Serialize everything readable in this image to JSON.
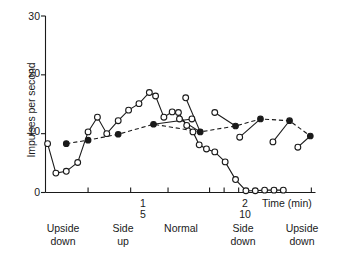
{
  "chart_data": {
    "type": "line",
    "title": "",
    "xlabel": "Time (min)",
    "ylabel": "Impulses per second",
    "ylim": [
      0,
      30
    ],
    "yticks": [
      0,
      10,
      20,
      30
    ],
    "ytick_labels": [
      "0",
      "10",
      "20",
      "30"
    ],
    "xlim": [
      0,
      2.6
    ],
    "xtick_labels_upper": [
      "1",
      "2"
    ],
    "xtick_labels_lower": [
      "5",
      "10"
    ],
    "xtick_label_positions": [
      1.0,
      2.0
    ],
    "grid": false,
    "legend_position": "none",
    "orientation_bands": [
      {
        "line1": "Upside",
        "line2": "down",
        "center_x": 0.13
      },
      {
        "line1": "Side",
        "line2": "up",
        "center_x": 0.72
      },
      {
        "line1": "Normal",
        "line2": "",
        "center_x": 1.28
      },
      {
        "line1": "Side",
        "line2": "down",
        "center_x": 1.94
      },
      {
        "line1": "Upside",
        "line2": "down",
        "center_x": 2.44
      }
    ],
    "series": [
      {
        "name": "open-circle-series",
        "marker": "open circle",
        "linestyle": "solid",
        "x": [
          0.02,
          0.1,
          0.2,
          0.31,
          0.41,
          0.5,
          0.59,
          0.7,
          0.8,
          0.9,
          1.0,
          1.06,
          1.14,
          1.22,
          1.28,
          1.36,
          1.42,
          1.48,
          1.55,
          1.63,
          1.73,
          1.83,
          1.93,
          2.02,
          2.11,
          2.2,
          2.29
        ],
        "y": [
          8.3,
          3.3,
          3.6,
          5.1,
          10.3,
          12.8,
          10.0,
          12.2,
          14.0,
          15.1,
          17.0,
          16.4,
          12.8,
          13.7,
          13.6,
          11.4,
          10.3,
          8.1,
          7.4,
          6.9,
          5.2,
          2.2,
          0.3,
          0.3,
          0.4,
          0.4,
          0.4
        ]
      },
      {
        "name": "filled-circle-series",
        "marker": "filled circle",
        "linestyle": "dashed",
        "x": [
          0.2,
          0.41,
          0.7,
          1.04,
          1.49,
          1.83,
          2.07,
          2.35,
          2.55
        ],
        "y": [
          8.3,
          8.9,
          9.9,
          11.6,
          10.3,
          11.3,
          12.5,
          12.2,
          9.6
        ]
      },
      {
        "name": "recovery-connectors",
        "marker": "open circle",
        "linestyle": "solid",
        "segments": [
          {
            "from": [
              1.41,
              12.5
            ],
            "to": [
              1.04,
              11.6
            ]
          },
          {
            "from": [
              1.29,
              12.5
            ],
            "to": [
              1.49,
              10.3
            ]
          },
          {
            "from": [
              1.35,
              16.1
            ],
            "to": [
              1.49,
              10.3
            ]
          },
          {
            "from": [
              1.63,
              13.6
            ],
            "to": [
              1.83,
              11.3
            ]
          },
          {
            "from": [
              1.87,
              9.4
            ],
            "to": [
              2.07,
              12.5
            ]
          },
          {
            "from": [
              2.19,
              8.6
            ],
            "to": [
              2.35,
              12.2
            ]
          },
          {
            "from": [
              2.43,
              7.7
            ],
            "to": [
              2.55,
              9.6
            ]
          }
        ]
      }
    ]
  },
  "axis": {
    "ytick_0": "0",
    "ytick_10": "10",
    "ytick_20": "20",
    "ytick_30": "30",
    "xnum_1_upper": "1",
    "xnum_1_lower": "5",
    "xnum_2_upper": "2",
    "xnum_2_lower": "10",
    "time_label": "Time (min)",
    "y_axis_title": "Impulses per second"
  },
  "orientations": [
    {
      "top": "Upside",
      "bottom": "down"
    },
    {
      "top": "Side",
      "bottom": "up"
    },
    {
      "top": "Normal",
      "bottom": ""
    },
    {
      "top": "Side",
      "bottom": "down"
    },
    {
      "top": "Upside",
      "bottom": "down"
    }
  ],
  "caption": {
    "text": ""
  }
}
